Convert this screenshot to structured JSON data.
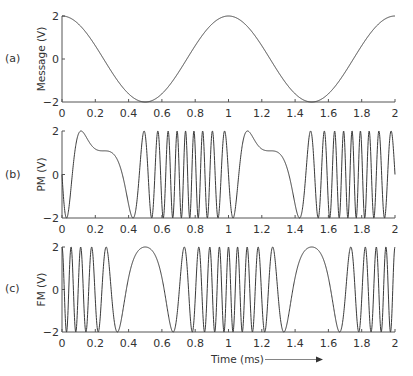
{
  "chart_data": [
    {
      "id": "a",
      "type": "line",
      "panel_label": "(a)",
      "title": "",
      "xlabel": "",
      "ylabel": "Message (V)",
      "xlim": [
        0,
        2
      ],
      "ylim": [
        -2,
        2
      ],
      "xticks": [
        "0",
        "0.2",
        "0.4",
        "0.6",
        "0.8",
        "1",
        "1.2",
        "1.4",
        "1.6",
        "1.8",
        "2"
      ],
      "yticks": [
        "−2",
        "0",
        "2"
      ],
      "grid": false,
      "series": [
        {
          "name": "message",
          "formula": "m(t) = 2·cos(2π·t)",
          "amplitude": 2,
          "freq_khz": 1,
          "x": [
            0,
            0.25,
            0.5,
            0.75,
            1.0,
            1.25,
            1.5,
            1.75,
            2.0
          ],
          "y": [
            2,
            0,
            -2,
            0,
            2,
            0,
            -2,
            0,
            2
          ]
        }
      ]
    },
    {
      "id": "b",
      "type": "line",
      "panel_label": "(b)",
      "title": "",
      "xlabel": "",
      "ylabel": "PM (V)",
      "xlim": [
        0,
        2
      ],
      "ylim": [
        -2,
        2
      ],
      "xticks": [
        "0",
        "0.2",
        "0.4",
        "0.6",
        "0.8",
        "1",
        "1.2",
        "1.4",
        "1.6",
        "1.8",
        "2"
      ],
      "yticks": [
        "−2",
        "0",
        "2"
      ],
      "grid": false,
      "series": [
        {
          "name": "PM signal",
          "formula": "2·cos(2π·fc·t + kp·m(t) + φ)",
          "amplitude": 2,
          "carrier_khz": 10,
          "kp": 5,
          "phase_offset": -8.4292
        }
      ]
    },
    {
      "id": "c",
      "type": "line",
      "panel_label": "(c)",
      "title": "",
      "xlabel": "Time (ms)",
      "ylabel": "FM (V)",
      "xlim": [
        0,
        2
      ],
      "ylim": [
        -2,
        2
      ],
      "xticks": [
        "0",
        "0.2",
        "0.4",
        "0.6",
        "0.8",
        "1",
        "1.2",
        "1.4",
        "1.6",
        "1.8",
        "2"
      ],
      "yticks": [
        "−2",
        "0",
        "2"
      ],
      "grid": false,
      "series": [
        {
          "name": "FM signal",
          "formula": "2·cos(2π·fc·t + 2π·kf·∫m)",
          "amplitude": 2,
          "carrier_khz": 10,
          "deviation_khz": 8.5
        }
      ]
    }
  ],
  "annotations": {
    "time_label": "Time (ms)",
    "arrow": "→"
  },
  "colors": {
    "line": "#3a3a3a",
    "axis": "#555555",
    "text": "#333333"
  }
}
